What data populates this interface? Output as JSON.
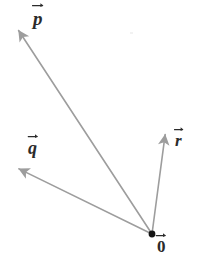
{
  "figure": {
    "background_color": "#ffffff",
    "width": 197,
    "height": 270
  },
  "origin": {
    "label": "0",
    "has_overline_arrow": true,
    "dot_color": "#141414",
    "dot_radius": 3.4,
    "x": 152,
    "y": 234,
    "label_x": 157,
    "label_y": 238
  },
  "style": {
    "line_color": "#9d9d9d",
    "line_width": 1.6,
    "label_color": "#2b2b2b",
    "arrowhead_color": "#9d9d9d"
  },
  "vectors": [
    {
      "name": "p",
      "label": "p",
      "has_overline_arrow": true,
      "from_x": 152,
      "from_y": 234,
      "to_x": 15,
      "to_y": 25,
      "label_x": 33,
      "label_y": 9,
      "color": "#9d9d9d"
    },
    {
      "name": "q",
      "label": "q",
      "has_overline_arrow": true,
      "from_x": 152,
      "from_y": 234,
      "to_x": 13,
      "to_y": 166,
      "label_x": 28,
      "label_y": 139,
      "color": "#9d9d9d"
    },
    {
      "name": "r",
      "label": "r",
      "has_overline_arrow": true,
      "from_x": 152,
      "from_y": 234,
      "to_x": 166,
      "to_y": 128,
      "label_x": 175,
      "label_y": 132,
      "color": "#9d9d9d"
    }
  ],
  "chart_data": {
    "type": "scatter",
    "xlabel": "",
    "ylabel": "",
    "legend": [],
    "annotations": [
      "p",
      "q",
      "r",
      "0"
    ],
    "series": [
      {
        "name": "p",
        "x": [
          152,
          15
        ],
        "y": [
          234,
          25
        ]
      },
      {
        "name": "q",
        "x": [
          152,
          13
        ],
        "y": [
          234,
          166
        ]
      },
      {
        "name": "r",
        "x": [
          152,
          166
        ],
        "y": [
          234,
          128
        ]
      }
    ]
  }
}
